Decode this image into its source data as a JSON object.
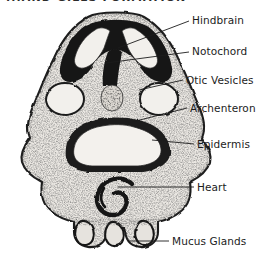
{
  "figure": {
    "title_partial": "...AND GILLS FORMATION",
    "caption": "",
    "background_color": "#ffffff",
    "ink_color": "#1c1c1c",
    "specimen": "amphibian embryo transverse section"
  },
  "labels": [
    {
      "id": "hindbrain",
      "text": "Hindbrain",
      "x": 192,
      "y": 14,
      "leader": {
        "x1": 189,
        "y1": 21,
        "x2": 118,
        "y2": 48
      }
    },
    {
      "id": "notochord",
      "text": "Notochord",
      "x": 192,
      "y": 45,
      "leader": {
        "x1": 189,
        "y1": 52,
        "x2": 106,
        "y2": 63
      }
    },
    {
      "id": "otic-vesicles",
      "text": "Otic Vesicles",
      "x": 186,
      "y": 74,
      "leader": {
        "x1": 183,
        "y1": 80,
        "x2": 139,
        "y2": 90
      }
    },
    {
      "id": "archenteron",
      "text": "Archenteron",
      "x": 190,
      "y": 102,
      "leader": {
        "x1": 187,
        "y1": 108,
        "x2": 128,
        "y2": 123
      }
    },
    {
      "id": "epidermis",
      "text": "Epidermis",
      "x": 197,
      "y": 138,
      "leader": {
        "x1": 194,
        "y1": 144,
        "x2": 152,
        "y2": 140
      }
    },
    {
      "id": "heart",
      "text": "Heart",
      "x": 197,
      "y": 181,
      "leader": {
        "x1": 194,
        "y1": 187,
        "x2": 118,
        "y2": 187
      }
    },
    {
      "id": "mucus-glands",
      "text": "Mucus Glands",
      "x": 172,
      "y": 235,
      "leader": {
        "x1": 169,
        "y1": 241,
        "x2": 128,
        "y2": 241
      }
    }
  ],
  "structures": [
    {
      "id": "epidermis-outline",
      "name": "Epidermis",
      "tone": "stippled"
    },
    {
      "id": "hindbrain-cavity",
      "name": "Hindbrain",
      "tone": "light-lumen"
    },
    {
      "id": "neural-mass",
      "name": "neural tissue",
      "tone": "dark"
    },
    {
      "id": "notochord-body",
      "name": "Notochord",
      "tone": "mottled"
    },
    {
      "id": "otic-left",
      "name": "Otic Vesicle (left)",
      "tone": "light-lumen"
    },
    {
      "id": "otic-right",
      "name": "Otic Vesicle (right)",
      "tone": "light-lumen"
    },
    {
      "id": "archenteron-lumen",
      "name": "Archenteron",
      "tone": "light-lumen"
    },
    {
      "id": "heart-tube",
      "name": "Heart",
      "tone": "dark-curved"
    },
    {
      "id": "mucus-gland-1",
      "name": "Mucus Gland",
      "tone": "lobe"
    },
    {
      "id": "mucus-gland-2",
      "name": "Mucus Gland",
      "tone": "lobe"
    },
    {
      "id": "mucus-gland-3",
      "name": "Mucus Gland",
      "tone": "lobe"
    }
  ]
}
